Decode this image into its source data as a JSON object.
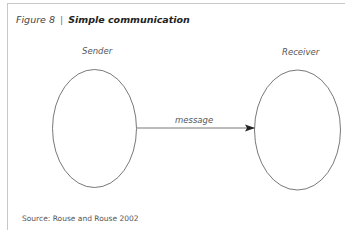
{
  "figure": {
    "number_label": "Figure 8",
    "separator": "|",
    "title": "Simple communication"
  },
  "diagram": {
    "nodes": [
      {
        "id": "sender",
        "label": "Sender"
      },
      {
        "id": "receiver",
        "label": "Receiver"
      }
    ],
    "edges": [
      {
        "from": "sender",
        "to": "receiver",
        "label": "message"
      }
    ]
  },
  "source": "Source: Rouse and Rouse 2002",
  "colors": {
    "stroke": "#555555",
    "frame": "#c8c8c8",
    "text": "#3a3a3a"
  }
}
